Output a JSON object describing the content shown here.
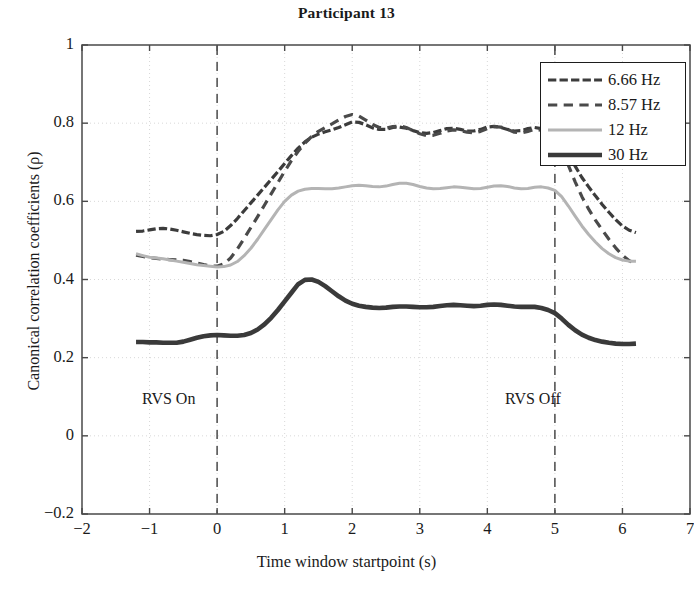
{
  "chart_data": {
    "type": "line",
    "title": "Participant 13",
    "xlabel": "Time window startpoint (s)",
    "ylabel": "Canonical correlation coefficients (ρ)",
    "xlim": [
      -2,
      7
    ],
    "ylim": [
      -0.2,
      1
    ],
    "xticks": [
      "-2",
      "-1",
      "0",
      "1",
      "2",
      "3",
      "4",
      "5",
      "6",
      "7"
    ],
    "xtick_values": [
      -2,
      -1,
      0,
      1,
      2,
      3,
      4,
      5,
      6,
      7
    ],
    "yticks": [
      "-0.2",
      "0",
      "0.2",
      "0.4",
      "0.6",
      "0.8",
      "1"
    ],
    "ytick_values": [
      -0.2,
      0,
      0.2,
      0.4,
      0.6,
      0.8,
      1
    ],
    "grid": true,
    "legend_position": "top-right",
    "x": [
      -1.2,
      -1.1,
      -1.0,
      -0.9,
      -0.8,
      -0.7,
      -0.6,
      -0.5,
      -0.4,
      -0.3,
      -0.2,
      -0.1,
      0.0,
      0.1,
      0.2,
      0.3,
      0.4,
      0.5,
      0.6,
      0.7,
      0.8,
      0.9,
      1.0,
      1.1,
      1.2,
      1.3,
      1.4,
      1.5,
      1.6,
      1.7,
      1.8,
      1.9,
      2.0,
      2.1,
      2.2,
      2.3,
      2.4,
      2.5,
      2.6,
      2.7,
      2.8,
      2.9,
      3.0,
      3.1,
      3.2,
      3.3,
      3.4,
      3.5,
      3.6,
      3.7,
      3.8,
      3.9,
      4.0,
      4.1,
      4.2,
      4.3,
      4.4,
      4.5,
      4.6,
      4.7,
      4.8,
      4.9,
      5.0,
      5.1,
      5.2,
      5.3,
      5.4,
      5.5,
      5.6,
      5.7,
      5.8,
      5.9,
      6.0,
      6.1,
      6.2
    ],
    "series": [
      {
        "name": "6.66 Hz",
        "color": "#3c3c3c",
        "style": "dash-dot",
        "width": 3.2,
        "values": [
          0.523,
          0.524,
          0.527,
          0.53,
          0.531,
          0.529,
          0.526,
          0.522,
          0.518,
          0.515,
          0.513,
          0.512,
          0.515,
          0.523,
          0.538,
          0.556,
          0.576,
          0.596,
          0.616,
          0.636,
          0.656,
          0.676,
          0.697,
          0.717,
          0.736,
          0.752,
          0.764,
          0.772,
          0.778,
          0.783,
          0.789,
          0.796,
          0.803,
          0.802,
          0.796,
          0.788,
          0.784,
          0.784,
          0.789,
          0.79,
          0.787,
          0.781,
          0.776,
          0.774,
          0.776,
          0.781,
          0.786,
          0.787,
          0.784,
          0.78,
          0.78,
          0.784,
          0.79,
          0.792,
          0.789,
          0.784,
          0.78,
          0.781,
          0.786,
          0.789,
          0.786,
          0.78,
          0.772,
          0.752,
          0.722,
          0.69,
          0.661,
          0.637,
          0.614,
          0.592,
          0.572,
          0.553,
          0.537,
          0.526,
          0.52
        ]
      },
      {
        "name": "8.57 Hz",
        "color": "#4a4a4a",
        "style": "dashed",
        "width": 3.2,
        "values": [
          0.462,
          0.459,
          0.456,
          0.454,
          0.452,
          0.451,
          0.45,
          0.449,
          0.446,
          0.442,
          0.438,
          0.435,
          0.434,
          0.44,
          0.455,
          0.478,
          0.505,
          0.533,
          0.561,
          0.59,
          0.619,
          0.648,
          0.677,
          0.704,
          0.728,
          0.749,
          0.766,
          0.779,
          0.789,
          0.798,
          0.808,
          0.817,
          0.822,
          0.818,
          0.808,
          0.797,
          0.789,
          0.787,
          0.791,
          0.793,
          0.789,
          0.781,
          0.773,
          0.768,
          0.769,
          0.774,
          0.78,
          0.783,
          0.781,
          0.777,
          0.775,
          0.779,
          0.786,
          0.791,
          0.79,
          0.784,
          0.777,
          0.775,
          0.779,
          0.784,
          0.782,
          0.775,
          0.764,
          0.734,
          0.692,
          0.65,
          0.612,
          0.58,
          0.552,
          0.527,
          0.503,
          0.481,
          0.462,
          0.448,
          0.44
        ]
      },
      {
        "name": "12 Hz",
        "color": "#b4b4b4",
        "style": "solid",
        "width": 3.0,
        "values": [
          0.466,
          0.461,
          0.457,
          0.455,
          0.453,
          0.45,
          0.447,
          0.444,
          0.441,
          0.438,
          0.436,
          0.434,
          0.432,
          0.433,
          0.437,
          0.446,
          0.461,
          0.48,
          0.503,
          0.528,
          0.553,
          0.578,
          0.6,
          0.616,
          0.626,
          0.631,
          0.633,
          0.633,
          0.632,
          0.632,
          0.634,
          0.637,
          0.64,
          0.641,
          0.64,
          0.638,
          0.637,
          0.639,
          0.643,
          0.646,
          0.646,
          0.643,
          0.638,
          0.634,
          0.632,
          0.633,
          0.635,
          0.637,
          0.636,
          0.634,
          0.632,
          0.633,
          0.636,
          0.639,
          0.64,
          0.638,
          0.634,
          0.632,
          0.633,
          0.636,
          0.637,
          0.634,
          0.628,
          0.612,
          0.588,
          0.562,
          0.537,
          0.515,
          0.496,
          0.479,
          0.466,
          0.456,
          0.45,
          0.447,
          0.447
        ]
      },
      {
        "name": "30 Hz",
        "color": "#3a3a3a",
        "style": "solid",
        "width": 4.6,
        "values": [
          0.24,
          0.24,
          0.239,
          0.239,
          0.238,
          0.238,
          0.238,
          0.241,
          0.246,
          0.251,
          0.255,
          0.257,
          0.258,
          0.257,
          0.256,
          0.256,
          0.258,
          0.263,
          0.272,
          0.285,
          0.302,
          0.322,
          0.344,
          0.366,
          0.388,
          0.399,
          0.4,
          0.394,
          0.383,
          0.37,
          0.357,
          0.346,
          0.338,
          0.333,
          0.33,
          0.328,
          0.327,
          0.328,
          0.33,
          0.331,
          0.331,
          0.33,
          0.329,
          0.329,
          0.33,
          0.332,
          0.334,
          0.335,
          0.334,
          0.333,
          0.332,
          0.333,
          0.335,
          0.336,
          0.335,
          0.333,
          0.331,
          0.33,
          0.33,
          0.33,
          0.327,
          0.322,
          0.314,
          0.3,
          0.284,
          0.27,
          0.259,
          0.251,
          0.245,
          0.241,
          0.238,
          0.236,
          0.235,
          0.235,
          0.236
        ]
      }
    ],
    "annotations": [
      {
        "text": "RVS On",
        "x": 0.0,
        "y": 0.12,
        "vline": true
      },
      {
        "text": "RVS Off",
        "x": 5.0,
        "y": 0.12,
        "vline": true
      }
    ]
  },
  "legend": {
    "items": [
      {
        "label": "6.66 Hz"
      },
      {
        "label": "8.57 Hz"
      },
      {
        "label": "12 Hz"
      },
      {
        "label": "30 Hz"
      }
    ]
  }
}
